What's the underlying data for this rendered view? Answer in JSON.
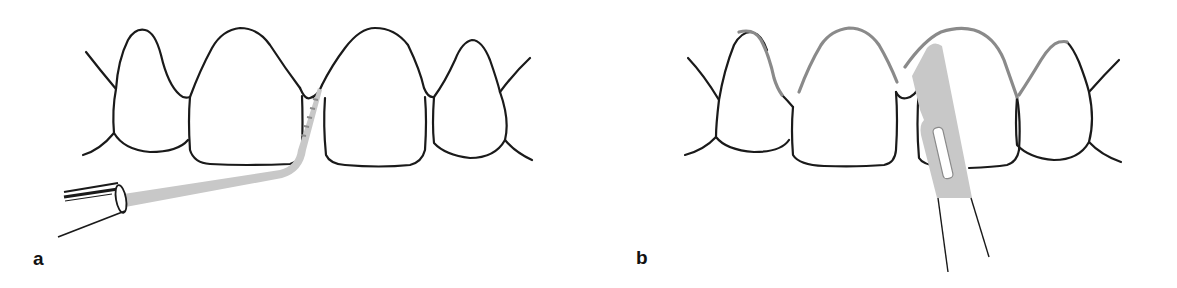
{
  "figure": {
    "panels": [
      {
        "label": "a",
        "description": "Periodontal probe inserted into interdental space between two central incisors",
        "instrument": "periodontal-probe"
      },
      {
        "label": "b",
        "description": "Scalpel blade placed on incisor with gingival margin outlined in gray",
        "instrument": "scalpel-blade"
      }
    ],
    "colors": {
      "outline": "#1a1a1a",
      "instrument_fill": "#c8c8c8",
      "gingival_highlight": "#8a8a8a"
    }
  }
}
